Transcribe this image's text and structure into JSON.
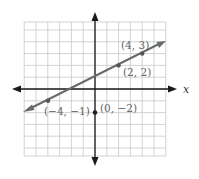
{
  "chart_data": {
    "type": "line",
    "title": "",
    "xlabel": "x",
    "ylabel": "",
    "xlim": [
      -6,
      6
    ],
    "ylim": [
      -5.7,
      5.7
    ],
    "grid": true,
    "line": {
      "equation": "y = 0.5x + 1",
      "slope": 0.5,
      "intercept": 1,
      "arrows": "both",
      "color": "#6a6a6a",
      "points": [
        {
          "x": -4,
          "y": -1,
          "label": "(−4, −1)"
        },
        {
          "x": 2,
          "y": 2,
          "label": "(2, 2)"
        },
        {
          "x": 4,
          "y": 3,
          "label": "(4, 3)"
        }
      ]
    },
    "extra_points": [
      {
        "x": 0,
        "y": -2,
        "label": "(0, −2)"
      }
    ]
  },
  "labels": {
    "x_axis": "x",
    "p1": "(−4, −1)",
    "p2": "(2, 2)",
    "p3": "(4, 3)",
    "p4": "(0, −2)"
  }
}
